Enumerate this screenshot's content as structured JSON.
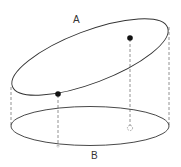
{
  "diagram": {
    "labels": {
      "top_ellipse": "A",
      "bottom_ellipse": "B"
    },
    "colors": {
      "stroke": "#333333",
      "dash": "#666666",
      "point": "#111111",
      "background": "#ffffff"
    }
  }
}
